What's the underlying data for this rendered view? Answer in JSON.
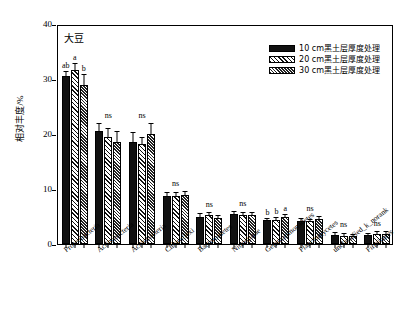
{
  "panel": {
    "title": "大豆"
  },
  "axes": {
    "ylabel": "相对丰度/%",
    "yticks": [
      0,
      10,
      20,
      30,
      40
    ],
    "ylim": [
      0,
      40
    ],
    "xlabel": ""
  },
  "legend": {
    "position": "top-right",
    "items": [
      {
        "label": "10 cm黑土层厚度处理",
        "pattern": "solid"
      },
      {
        "label": "20 cm黑土层厚度处理",
        "pattern": "hatch"
      },
      {
        "label": "30 cm黑土层厚度处理",
        "pattern": "dot"
      }
    ]
  },
  "chart_data": {
    "type": "bar",
    "title": "大豆",
    "xlabel": "",
    "ylabel": "相对丰度/%",
    "ylim": [
      0,
      40
    ],
    "yticks": [
      0,
      10,
      20,
      30,
      40
    ],
    "grid": false,
    "legend_position": "top-right",
    "categories": [
      "Proteobacteria",
      "Actinobacteria",
      "Acidobacteria",
      "Chloroflexi",
      "Bacteroidetes",
      "Nitrospirae",
      "Gemmatimonadetes",
      "Planctomycetes",
      "unclassified_k_norank",
      "Firmicutes"
    ],
    "series": [
      {
        "name": "10 cm黑土层厚度处理",
        "values": [
          30.5,
          20.6,
          18.6,
          8.7,
          4.9,
          5.4,
          4.3,
          4.1,
          1.6,
          1.6
        ],
        "errors": [
          0.7,
          1.2,
          1.5,
          0.5,
          0.6,
          0.5,
          0.3,
          0.4,
          0.4,
          0.3
        ]
      },
      {
        "name": "20 cm黑土层厚度处理",
        "values": [
          31.6,
          19.5,
          18.2,
          8.8,
          5.2,
          5.3,
          4.4,
          4.1,
          1.5,
          1.9
        ],
        "errors": [
          1.1,
          1.4,
          1.0,
          0.5,
          0.4,
          0.4,
          0.3,
          0.3,
          0.3,
          0.3
        ]
      },
      {
        "name": "30 cm黑土层厚度处理",
        "values": [
          28.9,
          18.6,
          20.0,
          9.0,
          4.7,
          5.2,
          5.0,
          4.6,
          1.4,
          1.9
        ],
        "errors": [
          1.9,
          1.8,
          1.8,
          0.5,
          0.4,
          0.4,
          0.3,
          0.3,
          0.3,
          0.3
        ]
      }
    ],
    "significance": [
      {
        "category": "Proteobacteria",
        "type": "letters",
        "letters": [
          "ab",
          "a",
          "b"
        ]
      },
      {
        "category": "Actinobacteria",
        "type": "ns",
        "text": "ns"
      },
      {
        "category": "Acidobacteria",
        "type": "ns",
        "text": "ns"
      },
      {
        "category": "Chloroflexi",
        "type": "ns",
        "text": "ns"
      },
      {
        "category": "Bacteroidetes",
        "type": "ns",
        "text": "ns"
      },
      {
        "category": "Nitrospirae",
        "type": "ns",
        "text": "ns"
      },
      {
        "category": "Gemmatimonadetes",
        "type": "letters",
        "letters": [
          "b",
          "b",
          "a"
        ]
      },
      {
        "category": "Planctomycetes",
        "type": "ns",
        "text": "ns"
      },
      {
        "category": "unclassified_k_norank",
        "type": "ns",
        "text": "ns"
      },
      {
        "category": "Firmicutes",
        "type": "ns",
        "text": "ns"
      }
    ]
  },
  "colors": {
    "axis": "#000000",
    "series_1": "#111111",
    "series_2": "#ffffff",
    "series_3": "#222222"
  }
}
